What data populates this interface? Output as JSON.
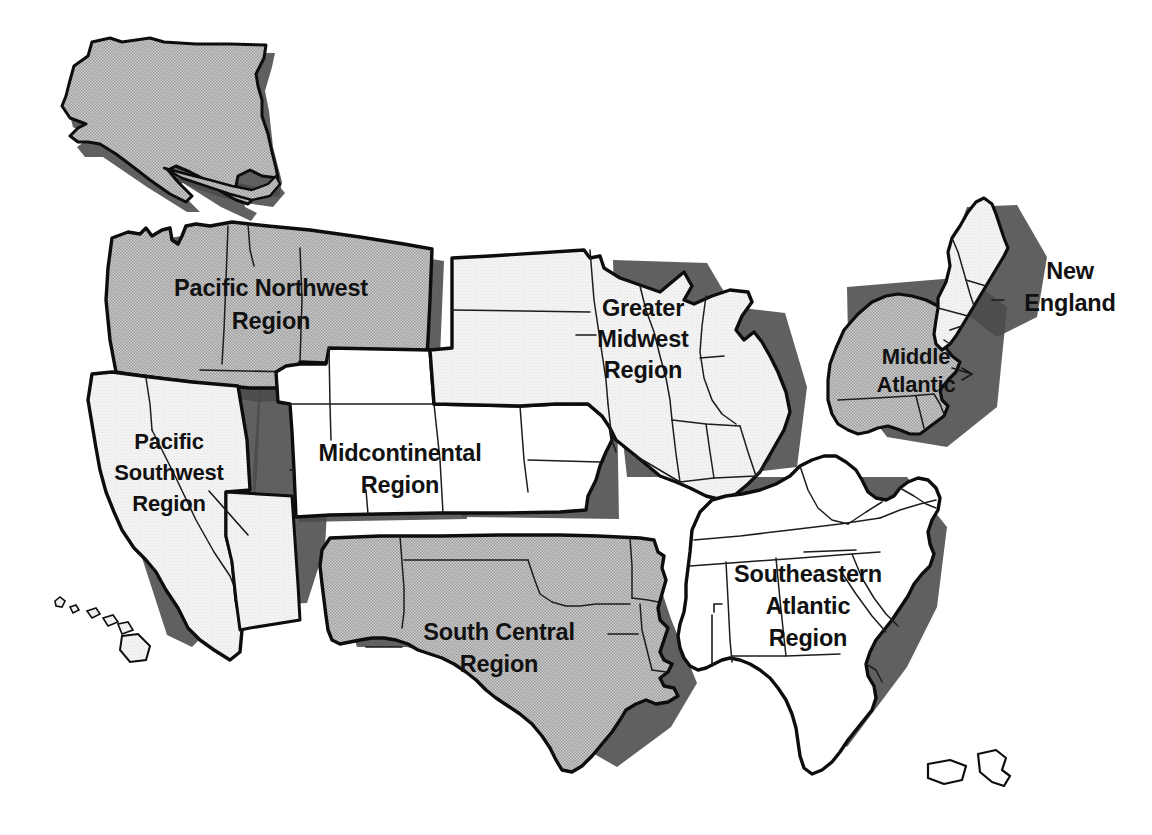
{
  "map": {
    "title": "United States Regional Map",
    "colors": {
      "shaded_region_fill": "#bdbdbd",
      "light_region_fill": "#f2f2f2",
      "white_region_fill": "#ffffff",
      "outline": "#0d0d0d",
      "state_border": "#1d1d1d",
      "shadow": "#4a4a4a",
      "label_text": "#111111",
      "background": "#ffffff"
    },
    "regions": [
      {
        "id": "pacific-northwest",
        "label_lines": [
          "Pacific Northwest",
          "Region"
        ],
        "label_text": "Pacific Northwest Region",
        "shading": "shaded",
        "fill": "#bdbdbd",
        "label_x": 271,
        "label_y": 290,
        "has_leader": false,
        "states": [
          "Alaska",
          "Washington",
          "Oregon",
          "Idaho",
          "Montana",
          "Wyoming"
        ]
      },
      {
        "id": "pacific-southwest",
        "label_lines": [
          "Pacific",
          "Southwest",
          "Region"
        ],
        "label_text": "Pacific Southwest Region",
        "shading": "light",
        "fill": "#f2f2f2",
        "label_x": 169,
        "label_y": 465,
        "has_leader": true,
        "states": [
          "California",
          "Nevada",
          "Arizona",
          "Hawaii"
        ]
      },
      {
        "id": "midcontinental",
        "label_lines": [
          "Midcontinental",
          "Region"
        ],
        "label_text": "Midcontinental Region",
        "shading": "white",
        "fill": "#ffffff",
        "label_x": 400,
        "label_y": 455,
        "has_leader": false,
        "states": [
          "Utah",
          "Colorado",
          "Kansas",
          "Missouri",
          "Nebraska",
          "Wyoming"
        ]
      },
      {
        "id": "greater-midwest",
        "label_lines": [
          "Greater",
          "Midwest",
          "Region"
        ],
        "label_text": "Greater Midwest Region",
        "shading": "light",
        "fill": "#f2f2f2",
        "label_x": 643,
        "label_y": 335,
        "has_leader": true,
        "states": [
          "North Dakota",
          "South Dakota",
          "Minnesota",
          "Wisconsin",
          "Michigan",
          "Iowa",
          "Illinois",
          "Indiana",
          "Ohio",
          "Kentucky"
        ]
      },
      {
        "id": "middle-atlantic",
        "label_lines": [
          "Middle",
          "Atlantic"
        ],
        "label_text": "Middle Atlantic",
        "shading": "shaded",
        "fill": "#bdbdbd",
        "label_x": 916,
        "label_y": 371,
        "has_leader": false,
        "states": [
          "New York",
          "Pennsylvania",
          "New Jersey",
          "Delaware"
        ]
      },
      {
        "id": "new-england",
        "label_lines": [
          "New",
          "England"
        ],
        "label_text": "New England",
        "shading": "light",
        "fill": "#f2f2f2",
        "label_x": 1070,
        "label_y": 287,
        "has_leader": false,
        "states": [
          "Maine",
          "New Hampshire",
          "Vermont",
          "Massachusetts",
          "Connecticut",
          "Rhode Island"
        ]
      },
      {
        "id": "south-central",
        "label_lines": [
          "South Central",
          "Region"
        ],
        "label_text": "South Central Region",
        "shading": "shaded",
        "fill": "#bdbdbd",
        "label_x": 499,
        "label_y": 642,
        "has_leader": true,
        "states": [
          "New Mexico",
          "Texas",
          "Oklahoma",
          "Arkansas",
          "Louisiana"
        ]
      },
      {
        "id": "southeastern-atlantic",
        "label_lines": [
          "Southeastern",
          "Atlantic",
          "Region"
        ],
        "label_text": "Southeastern Atlantic Region",
        "shading": "white",
        "fill": "#ffffff",
        "label_x": 808,
        "label_y": 611,
        "has_leader": true,
        "states": [
          "Virginia",
          "West Virginia",
          "North Carolina",
          "South Carolina",
          "Georgia",
          "Florida",
          "Alabama",
          "Mississippi",
          "Tennessee",
          "Maryland",
          "Puerto Rico"
        ]
      }
    ],
    "region_count": 8,
    "shading_legend": {
      "shaded": "gray halftone fill",
      "light": "very light gray fill",
      "white": "white fill"
    }
  }
}
